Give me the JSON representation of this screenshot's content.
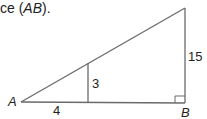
{
  "caption": {
    "prefix": "ce (",
    "italic": "AB",
    "suffix": ")."
  },
  "diagram": {
    "type": "similar-right-triangles",
    "vertices": {
      "A": "A",
      "B": "B"
    },
    "labels": {
      "small_base": "4",
      "small_height": "3",
      "large_height": "15"
    },
    "colors": {
      "line": "#6a6a6a",
      "text": "#222222"
    }
  }
}
